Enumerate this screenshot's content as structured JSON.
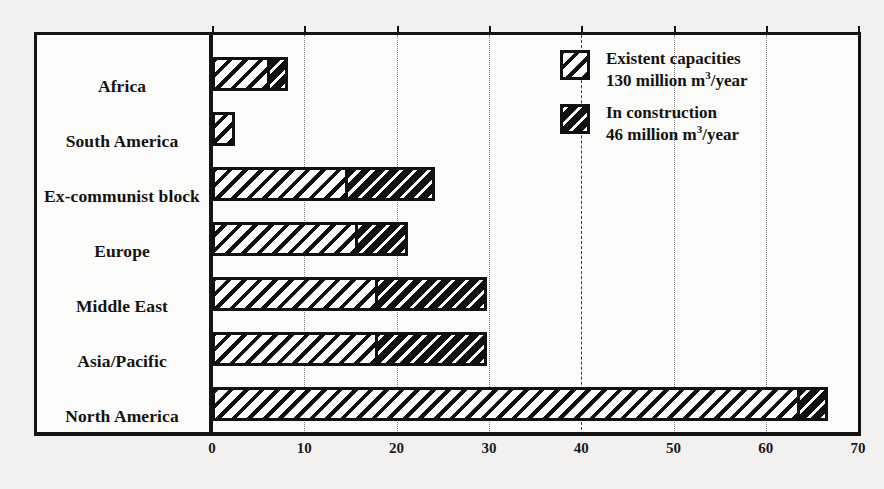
{
  "chart_data": {
    "type": "bar",
    "orientation": "horizontal",
    "stacked": true,
    "title": "",
    "subtitle": "",
    "xlabel": "",
    "ylabel": "",
    "xlim": [
      0,
      70
    ],
    "xticks": [
      0,
      10,
      20,
      30,
      40,
      50,
      60,
      70
    ],
    "xtick_labels": [
      "0",
      "10",
      "20",
      "30",
      "40",
      "50",
      "60",
      "70"
    ],
    "grid": true,
    "grid_axis": "x",
    "legend_position": "inside-top-right",
    "categories": [
      "Africa",
      "South America",
      "Ex-communist block",
      "Europe",
      "Middle East",
      "Asia/Pacific",
      "North America"
    ],
    "series": [
      {
        "name": "Existent capacities",
        "pattern": "light-diagonal-hatch",
        "values": [
          6.3,
          2.5,
          14.7,
          15.8,
          18.0,
          18.0,
          63.7
        ]
      },
      {
        "name": "In construction",
        "pattern": "dark-diagonal-hatch",
        "values": [
          1.9,
          0.0,
          9.5,
          5.4,
          11.8,
          11.8,
          3.0
        ]
      }
    ],
    "totals": [
      8.2,
      2.5,
      24.2,
      21.2,
      29.8,
      29.8,
      66.7
    ]
  },
  "legend": {
    "entries": [
      {
        "label": "Existent capacities",
        "value_line": "130 million  m",
        "unit_exponent": "3",
        "unit_suffix": "/year"
      },
      {
        "label": "In construction",
        "value_line": "46 million  m",
        "unit_exponent": "3",
        "unit_suffix": "/year"
      }
    ]
  },
  "colors": {
    "ink": "#111111",
    "paper": "#fbfbfa",
    "page_background": "#f2f1ef",
    "gridline": "#6b6b6b"
  }
}
